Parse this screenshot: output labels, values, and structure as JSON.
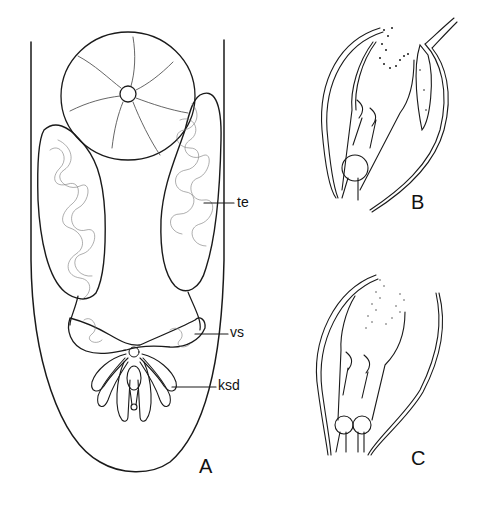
{
  "figure": {
    "type": "scientific anatomical line drawing",
    "panels": [
      {
        "id": "A",
        "label": "A",
        "subject": "posterior body region with male reproductive organs",
        "annotations": [
          {
            "id": "te",
            "text": "te"
          },
          {
            "id": "vs",
            "text": "vs"
          },
          {
            "id": "ksd",
            "text": "ksd"
          }
        ]
      },
      {
        "id": "B",
        "label": "B",
        "subject": "copulatory organ detail, lateral view"
      },
      {
        "id": "C",
        "label": "C",
        "subject": "copulatory organ detail, alternate view"
      }
    ],
    "colors": {
      "background": "#ffffff",
      "ink": "#1a1a1a",
      "fine_ink": "#555555"
    }
  }
}
